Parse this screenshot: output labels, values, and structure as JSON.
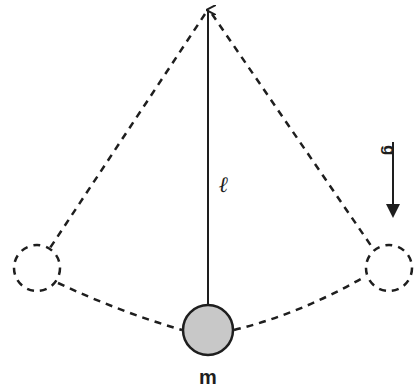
{
  "diagram": {
    "title": "",
    "type": "pendulum",
    "labels": {
      "length": "ℓ",
      "mass": "m",
      "gravity": "g"
    },
    "colors": {
      "stroke": "#1e1e1e",
      "bob_fill": "#c8c8c8",
      "background": "#ffffff"
    },
    "elements": [
      {
        "id": "pivot",
        "kind": "point",
        "x": 208,
        "y": 10
      },
      {
        "id": "string",
        "kind": "solid-line",
        "from": "pivot",
        "to": "bob"
      },
      {
        "id": "bob",
        "kind": "filled-circle",
        "cx": 208,
        "cy": 330,
        "r": 25,
        "label": "m"
      },
      {
        "id": "left-extreme",
        "kind": "dashed-circle",
        "cx": 37,
        "cy": 268,
        "r": 23
      },
      {
        "id": "right-extreme",
        "kind": "dashed-circle",
        "cx": 389,
        "cy": 268,
        "r": 23
      },
      {
        "id": "left-string",
        "kind": "dashed-line",
        "from": "pivot",
        "to": "left-extreme"
      },
      {
        "id": "right-string",
        "kind": "dashed-line",
        "from": "pivot",
        "to": "right-extreme"
      },
      {
        "id": "swing-arc",
        "kind": "dashed-arc",
        "from": "left-extreme",
        "through": "bob",
        "to": "right-extreme"
      },
      {
        "id": "gravity-arrow",
        "kind": "arrow",
        "direction": "down",
        "label": "g"
      }
    ]
  }
}
